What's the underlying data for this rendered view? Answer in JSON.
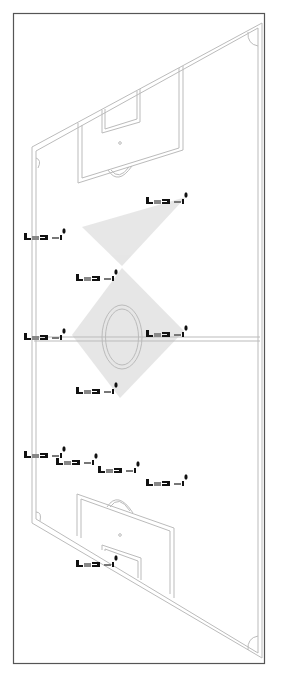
{
  "diagram": {
    "type": "soccer-pitch-formation",
    "description": "Perspective view of a soccer pitch with player figures and shaded formation polygons",
    "colors": {
      "background": "#ffffff",
      "frame": "#555555",
      "pitch_lines": "#bdbdbd",
      "shading": "#e6e6e6",
      "player": "#111111"
    },
    "frame": {
      "x": 13,
      "y": 13,
      "w": 251,
      "h": 650
    },
    "players": [
      {
        "id": 1,
        "x": 170,
        "y": 200
      },
      {
        "id": 2,
        "x": 48,
        "y": 236
      },
      {
        "id": 3,
        "x": 100,
        "y": 277
      },
      {
        "id": 4,
        "x": 48,
        "y": 336
      },
      {
        "id": 5,
        "x": 170,
        "y": 333
      },
      {
        "id": 6,
        "x": 100,
        "y": 390
      },
      {
        "id": 7,
        "x": 48,
        "y": 454
      },
      {
        "id": 8,
        "x": 80,
        "y": 461
      },
      {
        "id": 9,
        "x": 122,
        "y": 469
      },
      {
        "id": 10,
        "x": 170,
        "y": 482
      },
      {
        "id": 11,
        "x": 100,
        "y": 563
      }
    ],
    "shaded_areas": [
      {
        "name": "upper-triangle",
        "points": "82,227 186,197 122,266"
      },
      {
        "name": "center-diamond",
        "points": "122,268 184,331 120,398 72,335"
      }
    ]
  }
}
